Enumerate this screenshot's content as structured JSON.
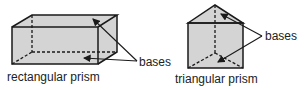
{
  "figures": [
    {
      "name": "rectangular prism",
      "label": "rectangular prism",
      "bases_label": "bases"
    },
    {
      "name": "triangular prism",
      "label": "triangular prism",
      "bases_label": "bases"
    }
  ],
  "colors": {
    "face_fill": "#d4d4d4",
    "stroke": "#1a1a1a",
    "text": "#222222"
  }
}
